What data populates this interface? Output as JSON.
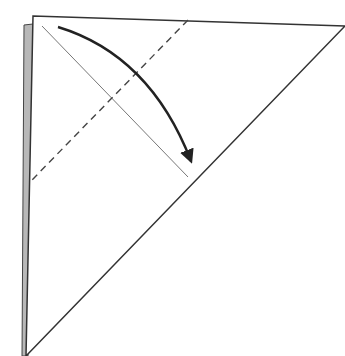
{
  "diagram": {
    "type": "origami-fold-step",
    "background": "#ffffff",
    "colors": {
      "outline": "#333333",
      "back_layer": "#b8b8b8",
      "crease": "#777777",
      "dashed": "#444444",
      "arrow": "#222222"
    },
    "paper": {
      "top_left": [
        33,
        16
      ],
      "top_right": [
        345,
        26
      ],
      "bottom_left": [
        26,
        356
      ]
    },
    "back_layer_strip": {
      "points": [
        [
          24,
          25
        ],
        [
          33,
          24
        ],
        [
          28,
          356
        ],
        [
          22,
          356
        ]
      ]
    },
    "crease_line": {
      "from": [
        42,
        26
      ],
      "to": [
        188,
        177
      ],
      "style": "solid-thin"
    },
    "valley_fold_line": {
      "from": [
        188,
        20
      ],
      "to": [
        31,
        181
      ],
      "style": "dashed"
    },
    "fold_arrow": {
      "from": [
        58,
        27
      ],
      "control": [
        150,
        55
      ],
      "to": [
        191,
        161
      ],
      "direction": "down-right"
    }
  }
}
